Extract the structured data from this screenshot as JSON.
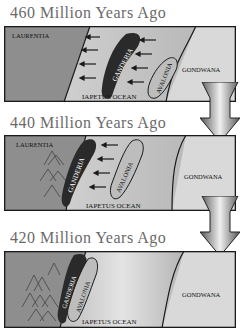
{
  "diagram": {
    "type": "plate-tectonics-sequence",
    "panels": [
      {
        "title": "460 Million Years Ago",
        "labels": {
          "west": "LAURENTIA",
          "ocean": "IAPETUS OCEAN",
          "east": "GONDWANA",
          "terrane1": "GANDERIA",
          "terrane2": "AVALONIA"
        },
        "arrows_left": 8,
        "mountains": false
      },
      {
        "title": "440 Million Years Ago",
        "labels": {
          "west": "LAURENTIA",
          "ocean": "IAPETUS OCEAN",
          "east": "GONDWANA",
          "terrane1": "GANDERIA",
          "terrane2": "AVALONIA"
        },
        "arrows_left": 4,
        "mountains": true
      },
      {
        "title": "420 Million Years Ago",
        "labels": {
          "west": "",
          "ocean": "IAPETUS OCEAN",
          "east": "GONDWANA",
          "terrane1": "GANDERIA",
          "terrane2": "AVALONIA"
        },
        "arrows_left": 0,
        "mountains": true
      }
    ],
    "transition_arrows": 2,
    "colors": {
      "laurentia": "#8e8e8e",
      "ocean": "#c8c8c8",
      "gondwana": "#d9d9d9",
      "ganderia": "#2a2a2a",
      "avalonia": "#bdbdbd",
      "frame": "#1a1a1a",
      "title": "#6a6a6a"
    }
  }
}
